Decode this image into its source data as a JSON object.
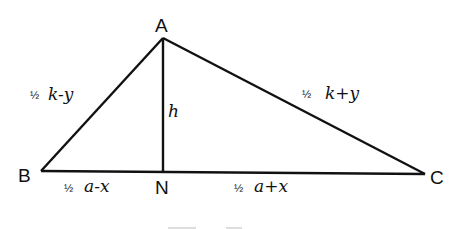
{
  "diagram": {
    "type": "triangle-with-altitude",
    "colors": {
      "line": "#111111",
      "background": "#ffffff"
    },
    "vertices": {
      "A": {
        "label": "A",
        "x": 163,
        "y": 38
      },
      "B": {
        "label": "B",
        "x": 41,
        "y": 171
      },
      "C": {
        "label": "C",
        "x": 425,
        "y": 174
      },
      "N": {
        "label": "N",
        "x": 163,
        "y": 172
      }
    },
    "sides": {
      "AB": {
        "frac": "½",
        "expr": "k-y"
      },
      "AC": {
        "frac": "½",
        "expr": "k+y"
      },
      "AN": {
        "expr": "h"
      },
      "BN": {
        "frac": "½",
        "expr": "a-x"
      },
      "NC": {
        "frac": "½",
        "expr": "a+x"
      }
    }
  }
}
